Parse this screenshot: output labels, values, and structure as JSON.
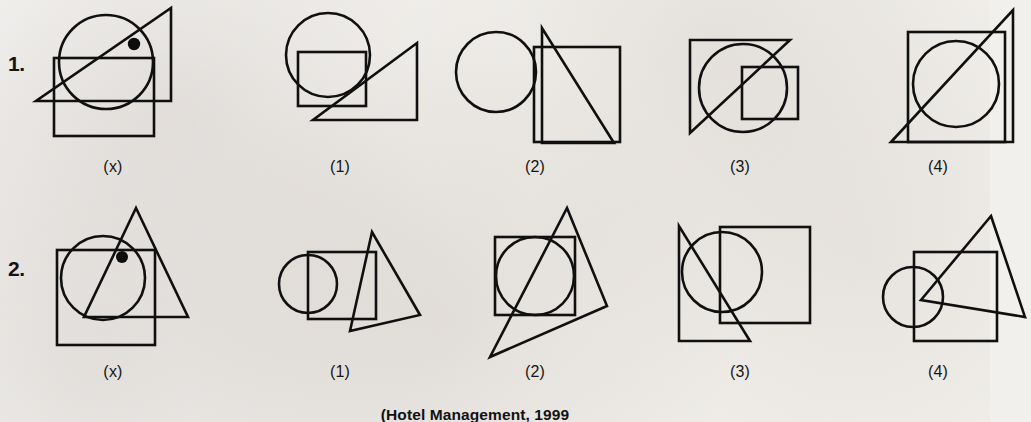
{
  "page": {
    "background_color": "#f2f0ec",
    "ink_color": "#101010",
    "source_credit": "(Hotel Management, 1999"
  },
  "rows": [
    {
      "number": "1.",
      "cells": [
        {
          "label": "(x)",
          "role": "problem-figure",
          "shapes": [
            "circle",
            "square",
            "right-triangle",
            "dot"
          ],
          "description": "Circle overlapped by a square below it and a right triangle whose hypotenuse runs diagonally; a filled dot sits inside the circle above the square's top edge."
        },
        {
          "label": "(1)",
          "role": "option",
          "shapes": [
            "circle",
            "square",
            "right-triangle"
          ],
          "description": "Circle at upper left overlapping a square; right triangle at lower right with hypotenuse rising to the right."
        },
        {
          "label": "(2)",
          "role": "option",
          "shapes": [
            "circle",
            "square",
            "right-triangle"
          ],
          "description": "Circle at left touching a large square; right triangle overlaps the square with hypotenuse falling to the right."
        },
        {
          "label": "(3)",
          "role": "option",
          "shapes": [
            "circle",
            "square",
            "right-triangle"
          ],
          "description": "Large right triangle containing a circle and a smaller square at the right."
        },
        {
          "label": "(4)",
          "role": "option",
          "shapes": [
            "circle",
            "square",
            "right-triangle"
          ],
          "description": "Square enclosing a circle, with a right triangle whose hypotenuse crosses the square diagonally."
        }
      ]
    },
    {
      "number": "2.",
      "cells": [
        {
          "label": "(x)",
          "role": "problem-figure",
          "shapes": [
            "circle",
            "square",
            "triangle",
            "dot"
          ],
          "description": "Square overlapped by a circle and a tall triangle; a filled dot sits inside the circle near the triangle's left edge."
        },
        {
          "label": "(1)",
          "role": "option",
          "shapes": [
            "circle",
            "square",
            "triangle"
          ],
          "description": "Small circle at left half inside a square; a narrow triangle leans over the square's right portion."
        },
        {
          "label": "(2)",
          "role": "option",
          "shapes": [
            "circle",
            "square",
            "triangle"
          ],
          "description": "Square enclosing a circle with a large slanted triangle crossing through both."
        },
        {
          "label": "(3)",
          "role": "option",
          "shapes": [
            "circle",
            "square",
            "right-triangle"
          ],
          "description": "Large square at the right, circle at the left overlapping it, and a right triangle at the far left."
        },
        {
          "label": "(4)",
          "role": "option",
          "shapes": [
            "circle",
            "square",
            "triangle"
          ],
          "description": "Circle at left overlapping a square; a tall thin triangle spans from above the square down to its right."
        }
      ]
    }
  ]
}
